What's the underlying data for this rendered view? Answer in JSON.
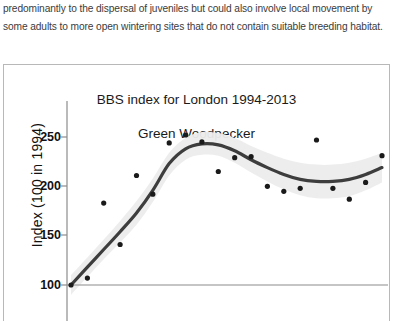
{
  "prose": {
    "paragraph": "predominantly to the dispersal of juveniles but could also involve local movement by some adults to more open wintering sites that do not contain suitable breeding habitat."
  },
  "figure": {
    "title_line1": "BBS index for London 1994-2013",
    "title_line2": "Green Woodpecker",
    "ylabel": "Index (100 in 1994)",
    "ytick_labels": [
      "250",
      "200",
      "150",
      "100"
    ],
    "reference_line_value": "100"
  },
  "colors": {
    "trend_line": "#3d3d3d",
    "confidence_band": "#ebebeb",
    "point": "#1a1a1a",
    "axis": "#8c8c8c",
    "panel_border": "#b8b8b8",
    "text": "#111111",
    "prose_text": "#3b3b3b"
  },
  "chart_data": {
    "type": "scatter",
    "title": "BBS index for London 1994-2013\nGreen Woodpecker",
    "subtitle": "Green Woodpecker",
    "xlabel": "",
    "ylabel": "Index (100 in 1994)",
    "ylim": [
      85,
      280
    ],
    "xlim": [
      1994,
      2013
    ],
    "yticks": [
      100,
      150,
      200,
      250
    ],
    "grid": false,
    "legend": "none",
    "reference_line": {
      "y": 100,
      "note": "baseline index = 100 in 1994"
    },
    "x": [
      1994,
      1995,
      1996,
      1997,
      1998,
      1999,
      2000,
      2001,
      2002,
      2003,
      2004,
      2005,
      2006,
      2007,
      2008,
      2009,
      2010,
      2011,
      2012,
      2013
    ],
    "series": [
      {
        "name": "Annual index",
        "type": "points",
        "values": [
          100,
          107,
          183,
          141,
          211,
          192,
          244,
          252,
          245,
          215,
          229,
          230,
          200,
          195,
          198,
          247,
          198,
          187,
          204,
          231
        ]
      },
      {
        "name": "Smoothed trend",
        "type": "line",
        "values": [
          100,
          118,
          136,
          154,
          173,
          196,
          223,
          238,
          243,
          242,
          236,
          227,
          219,
          212,
          207,
          205,
          205,
          207,
          212,
          219
        ]
      },
      {
        "name": "95% confidence band (upper)",
        "type": "band-upper",
        "values": [
          110,
          128,
          146,
          165,
          185,
          208,
          234,
          249,
          255,
          254,
          249,
          241,
          234,
          228,
          224,
          222,
          222,
          224,
          228,
          234
        ]
      },
      {
        "name": "95% confidence band (lower)",
        "type": "band-lower",
        "values": [
          90,
          108,
          126,
          143,
          161,
          184,
          211,
          227,
          232,
          231,
          224,
          214,
          205,
          197,
          191,
          188,
          188,
          190,
          196,
          204
        ]
      }
    ]
  }
}
